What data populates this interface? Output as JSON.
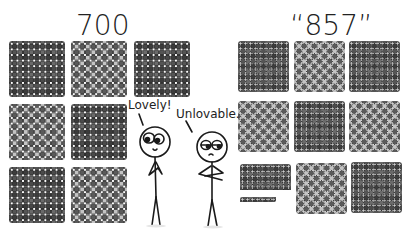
{
  "left_panel": {
    "title": "700",
    "blocks": [
      {
        "row": 1,
        "col": 1,
        "shade": "dark"
      },
      {
        "row": 1,
        "col": 2,
        "shade": "light"
      },
      {
        "row": 1,
        "col": 3,
        "shade": "dark"
      },
      {
        "row": 2,
        "col": 1,
        "shade": "light"
      },
      {
        "row": 2,
        "col": 2,
        "shade": "dark"
      },
      {
        "row": 3,
        "col": 1,
        "shade": "dark"
      },
      {
        "row": 3,
        "col": 2,
        "shade": "light"
      }
    ],
    "block_grid": "10x10 dots per block",
    "total_dots": 700
  },
  "right_panel": {
    "title": "“857”",
    "blocks": [
      {
        "row": 1,
        "col": 1,
        "shade": "dark"
      },
      {
        "row": 1,
        "col": 2,
        "shade": "light"
      },
      {
        "row": 1,
        "col": 3,
        "shade": "dark"
      },
      {
        "row": 2,
        "col": 1,
        "shade": "light"
      },
      {
        "row": 2,
        "col": 2,
        "shade": "dark"
      },
      {
        "row": 2,
        "col": 3,
        "shade": "light"
      },
      {
        "row": 3,
        "col": 1,
        "shade": "dark",
        "partial": "5 rows of 10"
      },
      {
        "row": 3,
        "col": 1,
        "shade": "dark",
        "partial": "single row of 7"
      },
      {
        "row": 3,
        "col": 2,
        "shade": "light"
      },
      {
        "row": 3,
        "col": 3,
        "shade": "dark"
      }
    ],
    "total_dots": 857
  },
  "characters": {
    "left": {
      "speech": "Lovely!",
      "pose": "hands clasped, smiling, looking at left grid"
    },
    "right": {
      "speech": "Unlovable.",
      "pose": "arms crossed, frowning, looking at right grid"
    }
  },
  "colors": {
    "background": "#ffffff",
    "ink": "#222222",
    "dot_dark": "#3c3c3c",
    "dot_mid": "#6a6a6a",
    "dot_light": "#c4c4c4"
  }
}
